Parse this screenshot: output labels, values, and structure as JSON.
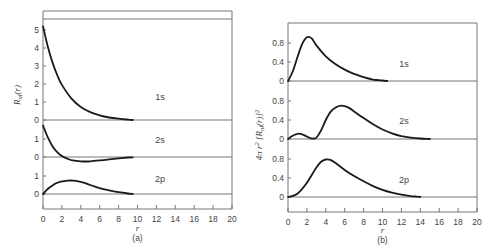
{
  "chart_data": [
    {
      "type": "line",
      "panel": "(a)",
      "title": "",
      "xlabel": "r",
      "ylabel": "R_nl(r)",
      "xlim": [
        0,
        20
      ],
      "x_ticks": [
        "0",
        "2",
        "4",
        "6",
        "8",
        "10",
        "12",
        "14",
        "16",
        "18",
        "20"
      ],
      "grid": false,
      "legend": "inline labels",
      "series": [
        {
          "name": "1s",
          "y_ticks": [
            "0",
            "1",
            "2",
            "3",
            "4",
            "5"
          ],
          "x": [
            0,
            0.5,
            1,
            1.5,
            2,
            3,
            4,
            5,
            6,
            7,
            8,
            9,
            9.5
          ],
          "values": [
            5.2,
            4.1,
            3.2,
            2.5,
            1.95,
            1.2,
            0.72,
            0.44,
            0.26,
            0.14,
            0.07,
            0.02,
            0.0
          ]
        },
        {
          "name": "2s",
          "y_ticks": [
            "0",
            "1"
          ],
          "x": [
            0,
            0.5,
            1,
            1.5,
            2,
            2.5,
            3,
            4,
            4.5,
            5,
            6,
            7,
            8,
            9,
            9.5
          ],
          "values": [
            1.75,
            1.1,
            0.6,
            0.27,
            0.05,
            -0.08,
            -0.17,
            -0.24,
            -0.25,
            -0.24,
            -0.19,
            -0.13,
            -0.08,
            -0.03,
            -0.02
          ]
        },
        {
          "name": "2p",
          "y_ticks": [
            "0",
            "1"
          ],
          "x": [
            0,
            0.5,
            1,
            1.5,
            2,
            3,
            4,
            5,
            6,
            7,
            8,
            9,
            9.5
          ],
          "values": [
            0.0,
            0.28,
            0.48,
            0.62,
            0.7,
            0.76,
            0.68,
            0.5,
            0.33,
            0.2,
            0.1,
            0.03,
            0.0
          ]
        }
      ],
      "caption": "(a)"
    },
    {
      "type": "line",
      "panel": "(b)",
      "title": "",
      "xlabel": "r",
      "ylabel": "4πr²[R_nl(r)]²",
      "xlim": [
        0,
        20
      ],
      "x_ticks": [
        "0",
        "2",
        "4",
        "6",
        "8",
        "10",
        "12",
        "14",
        "16",
        "18",
        "20"
      ],
      "grid": false,
      "legend": "inline labels",
      "series": [
        {
          "name": "1s",
          "y_ticks": [
            "0",
            "0.4",
            "0.8"
          ],
          "x": [
            0,
            0.5,
            1,
            1.5,
            2,
            2.5,
            3,
            4,
            5,
            6,
            7,
            8,
            9,
            10,
            10.5
          ],
          "values": [
            0.0,
            0.2,
            0.5,
            0.78,
            0.92,
            0.9,
            0.75,
            0.52,
            0.36,
            0.24,
            0.15,
            0.08,
            0.03,
            0.01,
            0.0
          ]
        },
        {
          "name": "2s",
          "y_ticks": [
            "0",
            "0.4",
            "0.8"
          ],
          "x": [
            0,
            0.5,
            1,
            1.5,
            2,
            2.5,
            3,
            3.5,
            4,
            4.5,
            5,
            5.5,
            6,
            6.5,
            7,
            8,
            9,
            10,
            11,
            12,
            13,
            14,
            15
          ],
          "values": [
            0.0,
            0.07,
            0.11,
            0.1,
            0.05,
            0.01,
            0.03,
            0.18,
            0.4,
            0.57,
            0.66,
            0.7,
            0.69,
            0.65,
            0.58,
            0.44,
            0.31,
            0.2,
            0.12,
            0.06,
            0.03,
            0.01,
            0.0
          ]
        },
        {
          "name": "2p",
          "y_ticks": [
            "0",
            "0.4",
            "0.8"
          ],
          "x": [
            0,
            1,
            2,
            3,
            3.5,
            4,
            4.5,
            5,
            6,
            7,
            8,
            9,
            10,
            11,
            12,
            13,
            14
          ],
          "values": [
            0.0,
            0.07,
            0.3,
            0.62,
            0.74,
            0.79,
            0.78,
            0.72,
            0.57,
            0.44,
            0.33,
            0.23,
            0.15,
            0.09,
            0.05,
            0.02,
            0.0
          ]
        }
      ],
      "caption": "(b)"
    }
  ],
  "colors": {
    "curve": "#1a1a1a",
    "axis": "#777777",
    "text": "#444444"
  }
}
